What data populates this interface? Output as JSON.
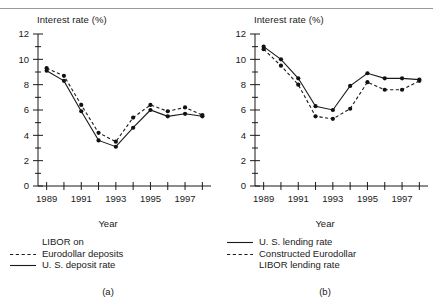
{
  "figure": {
    "panels": [
      {
        "id": "a",
        "panel_label": "(a)",
        "ylabel": "Interest rate (%)",
        "xlabel": "Year",
        "legend": [
          {
            "key": "none",
            "text": "LIBOR on"
          },
          {
            "key": "dashed",
            "text": "Eurodollar deposits"
          },
          {
            "key": "solid",
            "text": "U. S. deposit rate"
          }
        ]
      },
      {
        "id": "b",
        "panel_label": "(b)",
        "ylabel": "Interest rate (%)",
        "xlabel": "Year",
        "legend": [
          {
            "key": "solid",
            "text": "U. S. lending rate"
          },
          {
            "key": "dashed",
            "text": "Constructed Eurodollar"
          },
          {
            "key": "none",
            "text": "LIBOR lending rate"
          }
        ]
      }
    ]
  },
  "chart_data": [
    {
      "type": "line",
      "title": "(a)",
      "xlabel": "Year",
      "ylabel": "Interest rate (%)",
      "xlim": [
        1988.5,
        1998.5
      ],
      "ylim": [
        0,
        12
      ],
      "yticks": [
        0,
        2,
        4,
        6,
        8,
        10,
        12
      ],
      "yminorticks": [
        1,
        3,
        5,
        7,
        9,
        11
      ],
      "xticks": [
        1989,
        1990,
        1991,
        1992,
        1993,
        1994,
        1995,
        1996,
        1997,
        1998
      ],
      "xticklabels": [
        "1989",
        "",
        "1991",
        "",
        "1993",
        "",
        "1995",
        "",
        "1997",
        ""
      ],
      "grid": false,
      "legend_position": "below",
      "x": [
        1989,
        1990,
        1991,
        1992,
        1993,
        1994,
        1995,
        1996,
        1997,
        1998
      ],
      "series": [
        {
          "name": "LIBOR on Eurodollar deposits",
          "style": "dashed",
          "marker": "filled-circle",
          "values": [
            9.3,
            8.7,
            6.4,
            4.2,
            3.5,
            5.4,
            6.4,
            5.9,
            6.2,
            5.6
          ]
        },
        {
          "name": "U. S. deposit rate",
          "style": "solid",
          "marker": "filled-circle",
          "values": [
            9.1,
            8.3,
            5.9,
            3.6,
            3.1,
            4.6,
            6.0,
            5.5,
            5.7,
            5.5
          ]
        }
      ]
    },
    {
      "type": "line",
      "title": "(b)",
      "xlabel": "Year",
      "ylabel": "Interest rate (%)",
      "xlim": [
        1988.5,
        1998.5
      ],
      "ylim": [
        0,
        12
      ],
      "yticks": [
        0,
        2,
        4,
        6,
        8,
        10,
        12
      ],
      "yminorticks": [
        1,
        3,
        5,
        7,
        9,
        11
      ],
      "xticks": [
        1989,
        1990,
        1991,
        1992,
        1993,
        1994,
        1995,
        1996,
        1997,
        1998
      ],
      "xticklabels": [
        "1989",
        "",
        "1991",
        "",
        "1993",
        "",
        "1995",
        "",
        "1997",
        ""
      ],
      "grid": false,
      "legend_position": "below",
      "x": [
        1989,
        1990,
        1991,
        1992,
        1993,
        1994,
        1995,
        1996,
        1997,
        1998
      ],
      "series": [
        {
          "name": "U. S. lending rate",
          "style": "solid",
          "marker": "filled-circle",
          "values": [
            11.0,
            10.0,
            8.5,
            6.3,
            6.0,
            7.9,
            8.9,
            8.5,
            8.5,
            8.4
          ]
        },
        {
          "name": "Constructed Eurodollar LIBOR lending rate",
          "style": "dashed",
          "marker": "filled-circle",
          "values": [
            10.8,
            9.5,
            8.0,
            5.5,
            5.3,
            6.1,
            8.2,
            7.6,
            7.6,
            8.3
          ]
        }
      ]
    }
  ],
  "style": {
    "line_color": "#1a1a1a",
    "marker_color": "#111111",
    "axis_color": "#1a1a1a",
    "rule_color": "#9a9a9a",
    "background": "#ffffff"
  }
}
